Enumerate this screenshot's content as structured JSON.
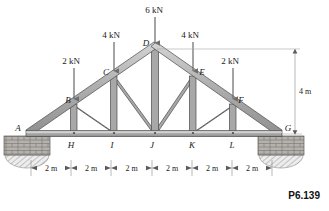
{
  "figure": {
    "problem_number": "P6.139",
    "type": "truss-diagram",
    "colors": {
      "member_fill": "#a8a8a8",
      "member_highlight": "#cfcfcf",
      "member_stroke": "#4a4a4a",
      "arrow": "#6e6e6e",
      "dimension": "#8c8c8c",
      "text": "#1a1a1a",
      "masonry": "#9e9e9e",
      "background": "#ffffff"
    },
    "joint_labels": [
      {
        "name": "A",
        "text": "A",
        "x": 18,
        "y": 131
      },
      {
        "name": "B",
        "text": "B",
        "x": 70,
        "y": 103
      },
      {
        "name": "C",
        "text": "C",
        "x": 105,
        "y": 76
      },
      {
        "name": "D",
        "text": "D",
        "x": 146,
        "y": 47
      },
      {
        "name": "E",
        "text": "E",
        "x": 200,
        "y": 76
      },
      {
        "name": "F",
        "text": "F",
        "x": 238,
        "y": 103
      },
      {
        "name": "G",
        "text": "G",
        "x": 284,
        "y": 131
      },
      {
        "name": "H",
        "text": "H",
        "x": 71,
        "y": 147
      },
      {
        "name": "I",
        "text": "I",
        "x": 111,
        "y": 147
      },
      {
        "name": "J",
        "text": "J",
        "x": 152,
        "y": 147
      },
      {
        "name": "K",
        "text": "K",
        "x": 192,
        "y": 147
      },
      {
        "name": "L",
        "text": "L",
        "x": 232,
        "y": 147
      }
    ],
    "loads": [
      {
        "name": "load-2kN-left",
        "label": "2 kN",
        "label_x": 63,
        "label_y": 63,
        "arrow_x": 74,
        "arrow_top": 68,
        "arrow_bottom": 104
      },
      {
        "name": "load-4kN-left",
        "label": "4 kN",
        "label_x": 100,
        "label_y": 37,
        "arrow_x": 114,
        "arrow_top": 42,
        "arrow_bottom": 78
      },
      {
        "name": "load-6kN-apex",
        "label": "6 kN",
        "label_x": 141,
        "label_y": 13,
        "arrow_x": 155,
        "arrow_top": 18,
        "arrow_bottom": 50
      },
      {
        "name": "load-4kN-right",
        "label": "4 kN",
        "label_x": 180,
        "label_y": 37,
        "arrow_x": 193,
        "arrow_top": 42,
        "arrow_bottom": 78
      },
      {
        "name": "load-2kN-right",
        "label": "2 kN",
        "label_x": 220,
        "label_y": 63,
        "arrow_x": 233,
        "arrow_top": 68,
        "arrow_bottom": 104
      }
    ],
    "height_dimension": {
      "label": "4 m",
      "label_x": 300,
      "label_y": 95,
      "line_x": 295,
      "top_y": 50,
      "bottom_y": 134
    },
    "span_dimensions": {
      "label": "2 m",
      "count": 6,
      "y": 168,
      "ticks": [
        31,
        71,
        111,
        152,
        192,
        232,
        272
      ],
      "segments": [
        {
          "label": "2 m",
          "center": 51
        },
        {
          "label": "2 m",
          "center": 91
        },
        {
          "label": "2 m",
          "center": 131.5
        },
        {
          "label": "2 m",
          "center": 172
        },
        {
          "label": "2 m",
          "center": 212
        },
        {
          "label": "2 m",
          "center": 252
        }
      ]
    },
    "geometry": {
      "bottom_chord_y": 133,
      "apex": {
        "x": 155,
        "y": 50
      },
      "left_end": {
        "x": 27,
        "y": 133
      },
      "right_end": {
        "x": 281,
        "y": 133
      },
      "top_nodes": [
        {
          "name": "A",
          "x": 27,
          "y": 133
        },
        {
          "name": "B",
          "x": 74,
          "y": 106
        },
        {
          "name": "C",
          "x": 114,
          "y": 78
        },
        {
          "name": "D",
          "x": 155,
          "y": 50
        },
        {
          "name": "E",
          "x": 193,
          "y": 78
        },
        {
          "name": "F",
          "x": 233,
          "y": 106
        },
        {
          "name": "G",
          "x": 281,
          "y": 133
        }
      ],
      "bottom_nodes": [
        {
          "name": "A",
          "x": 27,
          "y": 133
        },
        {
          "name": "H",
          "x": 74,
          "y": 133
        },
        {
          "name": "I",
          "x": 114,
          "y": 133
        },
        {
          "name": "J",
          "x": 155,
          "y": 133
        },
        {
          "name": "K",
          "x": 193,
          "y": 133
        },
        {
          "name": "L",
          "x": 233,
          "y": 133
        },
        {
          "name": "G",
          "x": 281,
          "y": 133
        }
      ],
      "verticals": [
        {
          "name": "B-H",
          "x": 74
        },
        {
          "name": "C-I",
          "x": 114
        },
        {
          "name": "D-J",
          "x": 155
        },
        {
          "name": "E-K",
          "x": 193
        },
        {
          "name": "F-L",
          "x": 233
        }
      ],
      "diagonals": [
        {
          "name": "B-I",
          "x1": 74,
          "y1": 106,
          "x2": 114,
          "y2": 133
        },
        {
          "name": "C-J",
          "x1": 114,
          "y1": 78,
          "x2": 155,
          "y2": 133
        },
        {
          "name": "E-J",
          "x1": 193,
          "y1": 78,
          "x2": 155,
          "y2": 133
        },
        {
          "name": "F-K",
          "x1": 233,
          "y1": 106,
          "x2": 193,
          "y2": 133
        }
      ]
    },
    "supports": [
      {
        "name": "support-left",
        "x": 27,
        "y": 136,
        "width": 48,
        "height": 20
      },
      {
        "name": "support-right",
        "x": 281,
        "y": 136,
        "width": 48,
        "height": 20
      }
    ]
  }
}
